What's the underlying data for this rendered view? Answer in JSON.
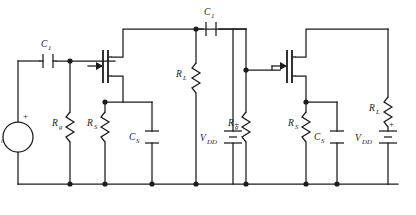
{
  "figure": {
    "background_color": "#ffffff",
    "line_color": "#1b1b1b"
  },
  "labels": {
    "source": {
      "symbol": "v",
      "subscript": "i",
      "polarity": "+"
    },
    "coupling_cap_input": {
      "symbol": "C",
      "subscript": "1"
    },
    "coupling_cap_interstage": {
      "symbol": "C",
      "subscript": "1"
    },
    "gate_resistor_stage1": {
      "symbol": "R",
      "subscript": "g"
    },
    "source_resistor_stage1": {
      "symbol": "R",
      "subscript": "S"
    },
    "source_cap_stage1": {
      "symbol": "C",
      "subscript": "S"
    },
    "supply_stage1": {
      "symbol": "V",
      "subscript": "DD",
      "polarity": "+"
    },
    "load_resistor_stage1": {
      "symbol": "R",
      "subscript": "L"
    },
    "gate_resistor_stage2": {
      "symbol": "R",
      "subscript": "g"
    },
    "source_resistor_stage2": {
      "symbol": "R",
      "subscript": "S"
    },
    "source_cap_stage2": {
      "symbol": "C",
      "subscript": "S"
    },
    "supply_stage2": {
      "symbol": "V",
      "subscript": "DD",
      "polarity": "+"
    },
    "load_resistor_stage2": {
      "symbol": "R",
      "subscript": "L"
    }
  },
  "components": [
    {
      "name": "input-voltage-source",
      "type": "voltage-source",
      "label": "vi"
    },
    {
      "name": "input-coupling-capacitor",
      "type": "capacitor",
      "label": "C1"
    },
    {
      "name": "gate-resistor-stage1",
      "type": "resistor",
      "label": "Rg"
    },
    {
      "name": "mosfet-stage1",
      "type": "n-channel-mosfet",
      "label": ""
    },
    {
      "name": "source-resistor-stage1",
      "type": "resistor",
      "label": "RS"
    },
    {
      "name": "source-bypass-capacitor-stage1",
      "type": "capacitor",
      "label": "CS"
    },
    {
      "name": "supply-battery-stage1",
      "type": "battery",
      "label": "VDD"
    },
    {
      "name": "load-resistor-stage1",
      "type": "resistor",
      "label": "RL"
    },
    {
      "name": "interstage-coupling-capacitor",
      "type": "capacitor",
      "label": "C1"
    },
    {
      "name": "gate-resistor-stage2",
      "type": "resistor",
      "label": "Rg"
    },
    {
      "name": "mosfet-stage2",
      "type": "n-channel-mosfet",
      "label": ""
    },
    {
      "name": "source-resistor-stage2",
      "type": "resistor",
      "label": "RS"
    },
    {
      "name": "source-bypass-capacitor-stage2",
      "type": "capacitor",
      "label": "CS"
    },
    {
      "name": "supply-battery-stage2",
      "type": "battery",
      "label": "VDD"
    },
    {
      "name": "load-resistor-stage2",
      "type": "resistor",
      "label": "RL"
    }
  ]
}
